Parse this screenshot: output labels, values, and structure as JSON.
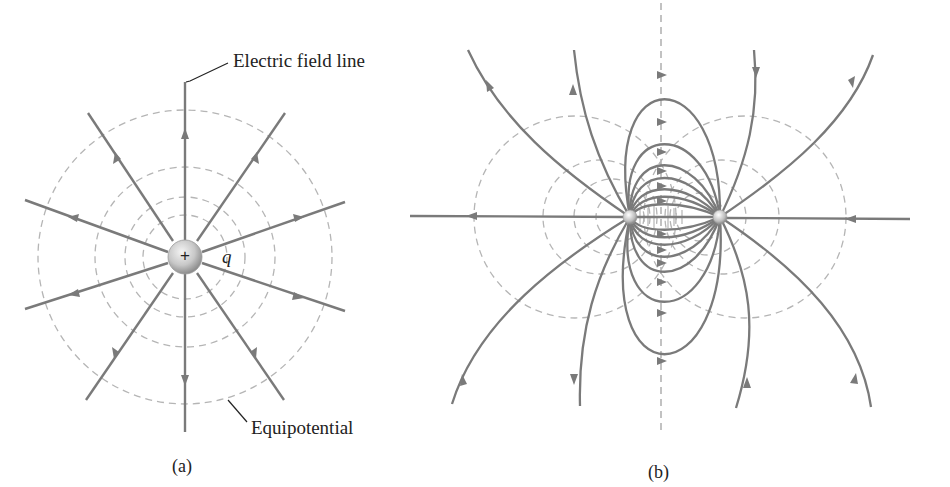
{
  "figure": {
    "panel_a": {
      "caption": "(a)",
      "field_line_label": "Electric field line",
      "equipotential_label": "Equipotential",
      "charge_symbol": "+",
      "charge_label": "q",
      "num_field_lines": 12,
      "num_equipotentials": 4
    },
    "panel_b": {
      "caption": "(b)",
      "num_charges": 2
    },
    "colors": {
      "field_line": "#7a7a7a",
      "equipotential": "#b5b5b5",
      "text": "#222222",
      "background": "#ffffff"
    }
  }
}
